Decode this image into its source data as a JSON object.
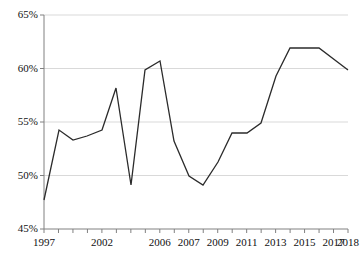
{
  "chart_data": {
    "type": "line",
    "title": "",
    "subtitle": "",
    "xlabel": "",
    "ylabel": "",
    "grid": true,
    "legend": false,
    "legend_position": "none",
    "series_color": "#2b2b2b",
    "grid_color": "#d9d9d9",
    "axis_color": "#808080",
    "ylim": [
      45,
      65
    ],
    "ytick_values": [
      45,
      50,
      55,
      60,
      65
    ],
    "ytick_labels": [
      "45%",
      "50%",
      "55%",
      "60%",
      "65%"
    ],
    "xlim": [
      "1997",
      "2018"
    ],
    "x": [
      "1997",
      "1998",
      "1999",
      "2000",
      "2001",
      "2002",
      "2003",
      "2004",
      "2005",
      "2006",
      "2007",
      "2008",
      "2009",
      "2010",
      "2011",
      "2012",
      "2013",
      "2014",
      "2015",
      "2016",
      "2017",
      "2018"
    ],
    "xtick_labels_shown": [
      "1997",
      "2002",
      "2006",
      "2007",
      "2009",
      "2011",
      "2013",
      "2015",
      "2017",
      "2018"
    ],
    "xtick_label_indices": [
      0,
      4,
      8,
      10,
      12,
      14,
      16,
      18,
      20,
      21
    ],
    "values": [
      48,
      54,
      53,
      53.5,
      54,
      58,
      51,
      60,
      61,
      53,
      50,
      49,
      52,
      54,
      54,
      55,
      59,
      62,
      62,
      60,
      60,
      60
    ],
    "series": [
      {
        "name": "",
        "values": [
          48,
          54,
          53,
          53.5,
          54,
          58,
          51,
          60,
          61,
          53,
          50,
          49,
          52,
          54,
          54,
          55,
          59,
          62,
          62,
          60,
          60,
          60
        ]
      }
    ],
    "points": [
      {
        "x": "1997",
        "y": 48
      },
      {
        "x": "1999",
        "y": 54
      },
      {
        "x": "2001",
        "y": 53
      },
      {
        "x": "2002",
        "y": 53.5
      },
      {
        "x": "2004",
        "y": 54
      },
      {
        "x": "2006",
        "y": 58
      },
      {
        "x": "2006b",
        "y": 51
      },
      {
        "x": "2007",
        "y": 60
      },
      {
        "x": "2008",
        "y": 61
      },
      {
        "x": "2009",
        "y": 53
      },
      {
        "x": "2010",
        "y": 50
      },
      {
        "x": "2011",
        "y": 49
      },
      {
        "x": "2012",
        "y": 52
      },
      {
        "x": "2013",
        "y": 54
      },
      {
        "x": "2014",
        "y": 54
      },
      {
        "x": "2015",
        "y": 55
      },
      {
        "x": "2016",
        "y": 59
      },
      {
        "x": "2017",
        "y": 62
      },
      {
        "x": "2017b",
        "y": 62
      },
      {
        "x": "2018",
        "y": 60
      }
    ],
    "polyline_pixels": "44,200 59,130 73,140 87,136 102,130 116,88 131,185 145,70 160,61 174,141 189,176 203,185 218,162 232,133 247,133 261,123 276,76 290,48 319,48 348,70"
  },
  "axes_geometry": {
    "plot_left": 44,
    "plot_right": 348,
    "plot_top": 15,
    "plot_bottom": 229,
    "n_xticks": 22
  }
}
